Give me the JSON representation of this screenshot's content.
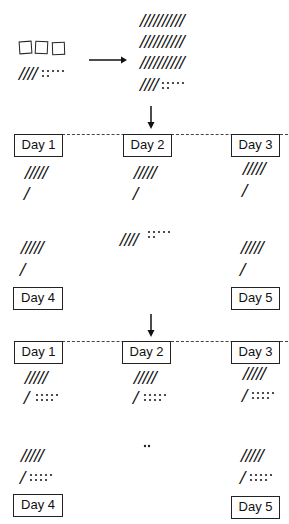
{
  "top": {
    "hundreds_squares": 3,
    "left_tallies": "////",
    "left_dots_top": ":::::",
    "left_dots_bottom": "",
    "right_rows": [
      "//////////",
      "//////////",
      "//////////",
      "////"
    ],
    "right_dots": ":::::"
  },
  "section1": {
    "days": [
      {
        "label": "Day 1",
        "tallies5": "/////",
        "tallies1": "/"
      },
      {
        "label": "Day 2",
        "tallies5": "/////",
        "tallies1": "/"
      },
      {
        "label": "Day 3",
        "tallies5": "/////",
        "tallies1": "/"
      },
      {
        "label": "Day 4",
        "tallies5": "/////",
        "tallies1": "/"
      },
      {
        "label": "Day 5",
        "tallies5": "/////",
        "tallies1": "/"
      }
    ],
    "remainder_tallies": "////",
    "remainder_dots": ":::::"
  },
  "section2": {
    "days": [
      {
        "label": "Day 1",
        "tallies5": "/////",
        "tallies1": "/",
        "dots": "::::"
      },
      {
        "label": "Day 2",
        "tallies5": "/////",
        "tallies1": "/",
        "dots": "::::"
      },
      {
        "label": "Day 3",
        "tallies5": "/////",
        "tallies1": "/",
        "dots": "::::"
      },
      {
        "label": "Day 4",
        "tallies5": "/////",
        "tallies1": "/",
        "dots": "::::"
      },
      {
        "label": "Day 5",
        "tallies5": "/////",
        "tallies1": "/",
        "dots": "::::"
      }
    ],
    "remainder_dots": ".."
  }
}
